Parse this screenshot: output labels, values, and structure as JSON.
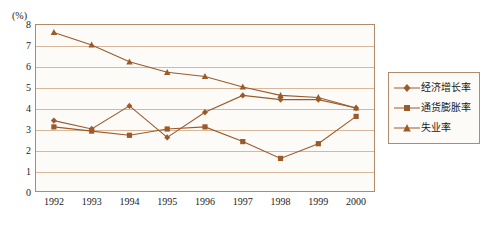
{
  "chart_data": {
    "type": "line",
    "title": "",
    "subtitle": "",
    "unit_label": "(%)",
    "xlabel": "",
    "ylabel": "",
    "grid": true,
    "legend_position": "right",
    "ylim": [
      0,
      8
    ],
    "yticks": [
      "0",
      "1",
      "2",
      "3",
      "4",
      "5",
      "6",
      "7",
      "8"
    ],
    "categories": [
      "1992",
      "1993",
      "1994",
      "1995",
      "1996",
      "1997",
      "1998",
      "1999",
      "2000"
    ],
    "series": [
      {
        "name": "经济增长率",
        "marker": "diamond",
        "color": "#9a5a2a",
        "values": [
          3.4,
          3.0,
          4.1,
          2.6,
          3.8,
          4.6,
          4.4,
          4.4,
          4.0
        ]
      },
      {
        "name": "通货膨胀率",
        "marker": "square",
        "color": "#9a5a2a",
        "values": [
          3.1,
          2.9,
          2.7,
          3.0,
          3.1,
          2.4,
          1.6,
          2.3,
          3.6
        ]
      },
      {
        "name": "失业率",
        "marker": "triangle",
        "color": "#9a5a2a",
        "values": [
          7.6,
          7.0,
          6.2,
          5.7,
          5.5,
          5.0,
          4.6,
          4.5,
          4.0
        ]
      }
    ]
  },
  "legend": {
    "items": [
      {
        "label": "经济增长率"
      },
      {
        "label": "通货膨胀率"
      },
      {
        "label": "失业率"
      }
    ]
  }
}
